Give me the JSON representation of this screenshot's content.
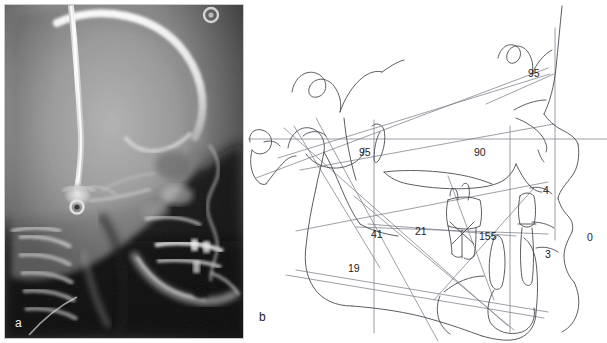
{
  "figure": {
    "kind": "two-panel cephalometric figure",
    "panels": [
      {
        "id": "a",
        "label": "a",
        "caption_letter": "a",
        "type": "lateral cephalometric radiograph"
      },
      {
        "id": "b",
        "label": "b",
        "caption_letter": "b",
        "type": "cephalometric tracing with measurements"
      }
    ]
  },
  "panel_a": {
    "label": "a",
    "label_color": "#f2f2f2",
    "background_color": "#0b0b0b",
    "border_color": "#c9c9c9"
  },
  "panel_b": {
    "label": "b",
    "label_color": "#1a1a1a",
    "background_color": "#ffffff",
    "line_color": "#4a4a52",
    "measurements": [
      {
        "name": "nasolabial-angle",
        "value": "95",
        "x": 280,
        "y": 68
      },
      {
        "name": "upper-incisor-angle",
        "value": "95",
        "x": 111,
        "y": 147
      },
      {
        "name": "palatal-plane-angle",
        "value": "90",
        "x": 226,
        "y": 147
      },
      {
        "name": "upper-lip-measure",
        "value": "4",
        "x": 295,
        "y": 185
      },
      {
        "name": "gonial-angle",
        "value": "41",
        "x": 123,
        "y": 229
      },
      {
        "name": "lower-incisor-angle",
        "value": "21",
        "x": 167,
        "y": 226
      },
      {
        "name": "interincisal-angle",
        "value": "155",
        "x": 231,
        "y": 231
      },
      {
        "name": "lower-lip-measure",
        "value": "3",
        "x": 297,
        "y": 249
      },
      {
        "name": "chin-measure",
        "value": "0",
        "x": 339,
        "y": 232
      },
      {
        "name": "mandibular-plane-angle",
        "value": "19",
        "x": 100,
        "y": 263
      }
    ]
  }
}
